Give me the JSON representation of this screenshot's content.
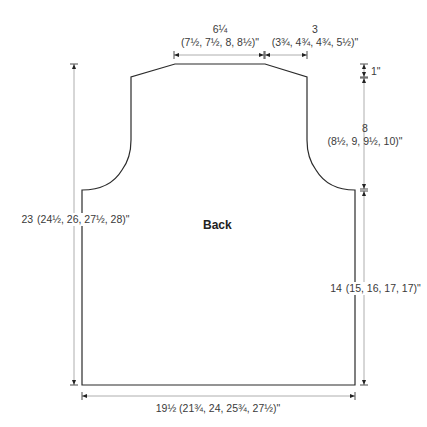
{
  "piece": {
    "title": "Back"
  },
  "measurements": {
    "neck_width": {
      "main": "6¼",
      "sizes": "(7½, 7½, 8, 8½)\""
    },
    "shoulder_width": {
      "main": "3",
      "sizes": "(3¾, 4¾, 4¾, 5½)\""
    },
    "shoulder_slope": {
      "main": "1\""
    },
    "armhole_depth": {
      "main": "8",
      "sizes": "(8½, 9, 9½, 10)\""
    },
    "total_length": {
      "main": "23",
      "sizes": "(24½, 26, 27½, 28)\""
    },
    "side_length": {
      "main": "14",
      "sizes": "(15, 16, 17, 17)\""
    },
    "bottom_width": {
      "main": "19½ (21¾, 24, 25¾, 27½)\""
    }
  },
  "colors": {
    "outline": "#2b2b2b",
    "dimension_line": "#9a9a9a",
    "arrow": "#222222"
  }
}
